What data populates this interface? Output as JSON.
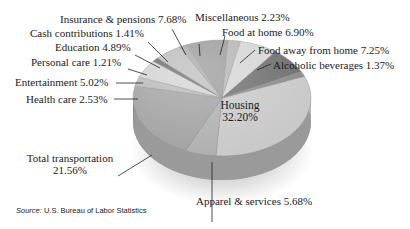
{
  "chart_data": {
    "type": "pie",
    "title": "",
    "style": "3d-grayscale",
    "slices": [
      {
        "label": "Housing",
        "value": 32.2,
        "color": "#c9c9c9"
      },
      {
        "label": "Apparel & services",
        "value": 5.68,
        "color": "#b0b0b0"
      },
      {
        "label": "Total transportation",
        "value": 21.56,
        "color": "#a2a2a2"
      },
      {
        "label": "Health care",
        "value": 2.53,
        "color": "#b9b9b9"
      },
      {
        "label": "Entertainment",
        "value": 5.02,
        "color": "#d3d3d3"
      },
      {
        "label": "Personal care",
        "value": 1.21,
        "color": "#6e6e6e"
      },
      {
        "label": "Education",
        "value": 4.89,
        "color": "#bdbdbd"
      },
      {
        "label": "Cash contributions",
        "value": 1.41,
        "color": "#a9a9a9"
      },
      {
        "label": "Insurance & pensions",
        "value": 7.68,
        "color": "#9c9c9c"
      },
      {
        "label": "Miscellaneous",
        "value": 2.23,
        "color": "#b5b5b5"
      },
      {
        "label": "Food at home",
        "value": 6.9,
        "color": "#d6d6d6"
      },
      {
        "label": "Food away from home",
        "value": 7.25,
        "color": "#6f6f6f"
      },
      {
        "label": "Alcoholic beverages",
        "value": 1.37,
        "color": "#8a8a8a"
      }
    ],
    "legend": "none (leader-line labels)"
  },
  "labels": {
    "housing_name": "Housing",
    "housing_pct": "32.20%",
    "apparel": "Apparel & services 5.68%",
    "transport_name": "Total transportation",
    "transport_pct": "21.56%",
    "health": "Health care 2.53%",
    "entertainment": "Entertainment 5.02%",
    "personal": "Personal care 1.21%",
    "education": "Education 4.89%",
    "cash": "Cash contributions 1.41%",
    "insurance": "Insurance & pensions 7.68%",
    "misc": "Miscellaneous 2.23%",
    "food_home": "Food at home 6.90%",
    "food_away": "Food away from home 7.25%",
    "alcohol": "Alcoholic beverages 1.37%"
  },
  "source": {
    "prefix": "Source:",
    "text": " U.S. Bureau of Labor Statistics"
  }
}
